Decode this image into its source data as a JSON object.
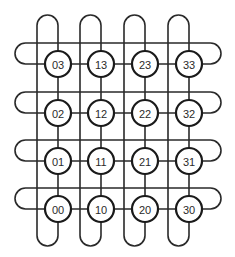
{
  "diagram": {
    "type": "folded-torus-4x4",
    "line_color": "#2a2a2a",
    "node_stroke": "#1a1a1a",
    "node_fill": "#ffffff",
    "columns_x": [
      58,
      101,
      145,
      189
    ],
    "rows_y": [
      64,
      113,
      161,
      209
    ],
    "node_radius": 13,
    "nodes": [
      {
        "id": "03",
        "label": "03",
        "col": 0,
        "row": 0
      },
      {
        "id": "13",
        "label": "13",
        "col": 1,
        "row": 0
      },
      {
        "id": "23",
        "label": "23",
        "col": 2,
        "row": 0
      },
      {
        "id": "33",
        "label": "33",
        "col": 3,
        "row": 0
      },
      {
        "id": "02",
        "label": "02",
        "col": 0,
        "row": 1
      },
      {
        "id": "12",
        "label": "12",
        "col": 1,
        "row": 1
      },
      {
        "id": "22",
        "label": "22",
        "col": 2,
        "row": 1
      },
      {
        "id": "32",
        "label": "32",
        "col": 3,
        "row": 1
      },
      {
        "id": "01",
        "label": "01",
        "col": 0,
        "row": 2
      },
      {
        "id": "11",
        "label": "11",
        "col": 1,
        "row": 2
      },
      {
        "id": "21",
        "label": "21",
        "col": 2,
        "row": 2
      },
      {
        "id": "31",
        "label": "31",
        "col": 3,
        "row": 2
      },
      {
        "id": "00",
        "label": "00",
        "col": 0,
        "row": 3
      },
      {
        "id": "10",
        "label": "10",
        "col": 1,
        "row": 3
      },
      {
        "id": "20",
        "label": "20",
        "col": 2,
        "row": 3
      },
      {
        "id": "30",
        "label": "30",
        "col": 3,
        "row": 3
      }
    ]
  }
}
